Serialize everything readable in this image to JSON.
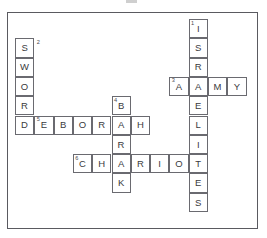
{
  "page": {
    "width": 267,
    "height": 238,
    "background_color": "#ffffff",
    "border_color": "#5a5a60",
    "cell_border_color": "#6a6a70",
    "letter_color": "#3a3a40",
    "clue_number_color": "#4a4a50"
  },
  "grid": {
    "cell_size": 19.3,
    "origin_x": 15,
    "origin_y": 19,
    "columns": 12,
    "rows": 10
  },
  "entries": [
    {
      "number": "1",
      "direction": "down",
      "answer": "ISRAELITES",
      "length": 10,
      "start_col": 9,
      "start_row": 0,
      "number_placement": "inside"
    },
    {
      "number": "2",
      "direction": "down",
      "answer": "SWORD",
      "length": 5,
      "start_col": 0,
      "start_row": 1,
      "number_placement": "outside-right"
    },
    {
      "number": "3",
      "direction": "across",
      "answer": "ARMY",
      "length": 4,
      "start_col": 8,
      "start_row": 3,
      "number_placement": "inside"
    },
    {
      "number": "4",
      "direction": "down",
      "answer": "BARAK",
      "length": 5,
      "start_col": 5,
      "start_row": 4,
      "number_placement": "inside"
    },
    {
      "number": "5",
      "direction": "across",
      "answer": "DEBORAH",
      "length": 7,
      "start_col": 0,
      "start_row": 5,
      "number_placement": "inside-second-cell"
    },
    {
      "number": "6",
      "direction": "across",
      "answer": "CHARIOT",
      "length": 7,
      "start_col": 3,
      "start_row": 7,
      "number_placement": "inside"
    }
  ],
  "cells": [
    {
      "id": "c-9-0",
      "col": 9,
      "row": 0,
      "letter": "I",
      "clue_number": "1"
    },
    {
      "id": "c-9-1",
      "col": 9,
      "row": 1,
      "letter": "S",
      "clue_number": ""
    },
    {
      "id": "c-9-2",
      "col": 9,
      "row": 2,
      "letter": "R",
      "clue_number": ""
    },
    {
      "id": "c-9-3",
      "col": 9,
      "row": 3,
      "letter": "A",
      "clue_number": ""
    },
    {
      "id": "c-9-4",
      "col": 9,
      "row": 4,
      "letter": "E",
      "clue_number": ""
    },
    {
      "id": "c-9-5",
      "col": 9,
      "row": 5,
      "letter": "L",
      "clue_number": ""
    },
    {
      "id": "c-9-6",
      "col": 9,
      "row": 6,
      "letter": "I",
      "clue_number": ""
    },
    {
      "id": "c-9-7",
      "col": 9,
      "row": 7,
      "letter": "T",
      "clue_number": ""
    },
    {
      "id": "c-9-8",
      "col": 9,
      "row": 8,
      "letter": "E",
      "clue_number": ""
    },
    {
      "id": "c-9-9",
      "col": 9,
      "row": 9,
      "letter": "S",
      "clue_number": ""
    },
    {
      "id": "c-0-1",
      "col": 0,
      "row": 1,
      "letter": "S",
      "clue_number": ""
    },
    {
      "id": "c-0-2",
      "col": 0,
      "row": 2,
      "letter": "W",
      "clue_number": ""
    },
    {
      "id": "c-0-3",
      "col": 0,
      "row": 3,
      "letter": "O",
      "clue_number": ""
    },
    {
      "id": "c-0-4",
      "col": 0,
      "row": 4,
      "letter": "R",
      "clue_number": ""
    },
    {
      "id": "c-0-5",
      "col": 0,
      "row": 5,
      "letter": "D",
      "clue_number": ""
    },
    {
      "id": "c-8-3",
      "col": 8,
      "row": 3,
      "letter": "A",
      "clue_number": "3"
    },
    {
      "id": "c-10-3",
      "col": 10,
      "row": 3,
      "letter": "M",
      "clue_number": ""
    },
    {
      "id": "c-11-3",
      "col": 11,
      "row": 3,
      "letter": "Y",
      "clue_number": ""
    },
    {
      "id": "c-5-4",
      "col": 5,
      "row": 4,
      "letter": "B",
      "clue_number": "4"
    },
    {
      "id": "c-5-6",
      "col": 5,
      "row": 6,
      "letter": "R",
      "clue_number": ""
    },
    {
      "id": "c-5-8",
      "col": 5,
      "row": 8,
      "letter": "K",
      "clue_number": ""
    },
    {
      "id": "c-1-5",
      "col": 1,
      "row": 5,
      "letter": "E",
      "clue_number": "5"
    },
    {
      "id": "c-2-5",
      "col": 2,
      "row": 5,
      "letter": "B",
      "clue_number": ""
    },
    {
      "id": "c-3-5",
      "col": 3,
      "row": 5,
      "letter": "O",
      "clue_number": ""
    },
    {
      "id": "c-4-5",
      "col": 4,
      "row": 5,
      "letter": "R",
      "clue_number": ""
    },
    {
      "id": "c-5-5",
      "col": 5,
      "row": 5,
      "letter": "A",
      "clue_number": ""
    },
    {
      "id": "c-6-5",
      "col": 6,
      "row": 5,
      "letter": "H",
      "clue_number": ""
    },
    {
      "id": "c-3-7",
      "col": 3,
      "row": 7,
      "letter": "C",
      "clue_number": "6"
    },
    {
      "id": "c-4-7",
      "col": 4,
      "row": 7,
      "letter": "H",
      "clue_number": ""
    },
    {
      "id": "c-5-7",
      "col": 5,
      "row": 7,
      "letter": "A",
      "clue_number": ""
    },
    {
      "id": "c-6-7",
      "col": 6,
      "row": 7,
      "letter": "R",
      "clue_number": ""
    },
    {
      "id": "c-7-7",
      "col": 7,
      "row": 7,
      "letter": "I",
      "clue_number": ""
    },
    {
      "id": "c-8-7",
      "col": 8,
      "row": 7,
      "letter": "O",
      "clue_number": ""
    }
  ],
  "outside_numbers": [
    {
      "id": "outside-2",
      "text": "2",
      "col": 1,
      "row": 1,
      "offset_x": 2.5,
      "offset_y": 1.5
    }
  ]
}
